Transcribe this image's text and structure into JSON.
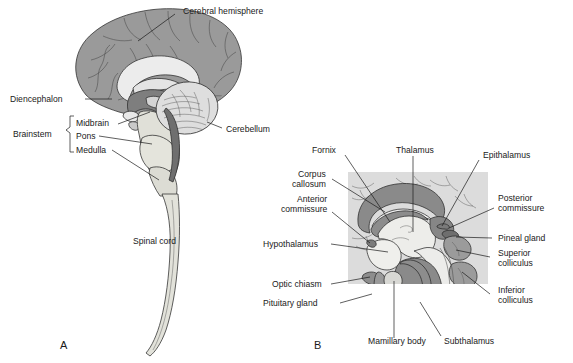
{
  "figure": {
    "type": "anatomical-diagram",
    "title": "",
    "panels": [
      {
        "id": "A",
        "letter": "A",
        "caption": "Midsagittal view of the brain and spinal cord",
        "labels": [
          {
            "name": "cerebral-hemisphere",
            "text": "Cerebral hemisphere"
          },
          {
            "name": "diencephalon",
            "text": "Diencephalon"
          },
          {
            "name": "brainstem",
            "text": "Brainstem"
          },
          {
            "name": "midbrain",
            "text": "Midbrain"
          },
          {
            "name": "pons",
            "text": "Pons"
          },
          {
            "name": "medulla",
            "text": "Medulla"
          },
          {
            "name": "cerebellum",
            "text": "Cerebellum"
          },
          {
            "name": "spinal-cord",
            "text": "Spinal cord"
          }
        ]
      },
      {
        "id": "B",
        "letter": "B",
        "caption": "Enlarged midsagittal view of the diencephalon and midbrain",
        "labels": [
          {
            "name": "fornix",
            "text": "Fornix"
          },
          {
            "name": "thalamus",
            "text": "Thalamus"
          },
          {
            "name": "epithalamus",
            "text": "Epithalamus"
          },
          {
            "name": "corpus-callosum-line1",
            "text": "Corpus"
          },
          {
            "name": "corpus-callosum-line2",
            "text": "callosum"
          },
          {
            "name": "anterior-commissure-line1",
            "text": "Anterior"
          },
          {
            "name": "anterior-commissure-line2",
            "text": "commissure"
          },
          {
            "name": "hypothalamus",
            "text": "Hypothalamus"
          },
          {
            "name": "optic-chiasm",
            "text": "Optic chiasm"
          },
          {
            "name": "pituitary-gland",
            "text": "Pituitary gland"
          },
          {
            "name": "posterior-commissure-line1",
            "text": "Posterior"
          },
          {
            "name": "posterior-commissure-line2",
            "text": "commissure"
          },
          {
            "name": "pineal-gland",
            "text": "Pineal gland"
          },
          {
            "name": "superior-colliculus-line1",
            "text": "Superior"
          },
          {
            "name": "superior-colliculus-line2",
            "text": "colliculus"
          },
          {
            "name": "inferior-colliculus-line1",
            "text": "Inferior"
          },
          {
            "name": "inferior-colliculus-line2",
            "text": "colliculus"
          },
          {
            "name": "mamillary-body",
            "text": "Mamillary body"
          },
          {
            "name": "subthalamus",
            "text": "Subthalamus"
          }
        ]
      }
    ],
    "colors": {
      "background": "#ffffff",
      "panel_b_backdrop": "#dcdcdc",
      "cortex_gray": "#9a9a9a",
      "deep_gray": "#8a8a8a",
      "light_tissue": "#e0e0d8",
      "pale_tissue": "#ececec",
      "outline": "#2b2b2b",
      "text": "#1a1a1a"
    }
  }
}
